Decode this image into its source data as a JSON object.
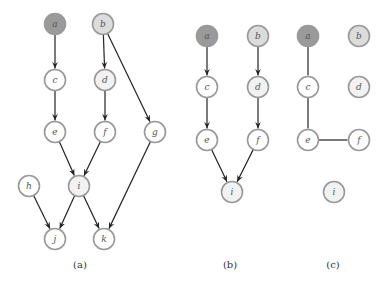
{
  "colors": {
    "dark_fill": "#9a9a9a",
    "light_fill": "#dcdcdc",
    "white_fill": "#ffffff",
    "very_light_fill": "#f2f2f2",
    "stroke": "#999999",
    "edge": "#222222"
  },
  "panels": [
    {
      "id": "a",
      "caption": "(a)",
      "caption_pos": [
        80,
        268
      ],
      "nodes": [
        {
          "id": "a",
          "label": "a",
          "x": 55,
          "y": 24,
          "fill": "dark"
        },
        {
          "id": "b",
          "label": "b",
          "x": 103,
          "y": 24,
          "fill": "light"
        },
        {
          "id": "c",
          "label": "c",
          "x": 55,
          "y": 80,
          "fill": "white"
        },
        {
          "id": "d",
          "label": "d",
          "x": 105,
          "y": 80,
          "fill": "very_light"
        },
        {
          "id": "e",
          "label": "e",
          "x": 55,
          "y": 132,
          "fill": "white"
        },
        {
          "id": "f",
          "label": "f",
          "x": 105,
          "y": 132,
          "fill": "white"
        },
        {
          "id": "g",
          "label": "g",
          "x": 155,
          "y": 132,
          "fill": "white"
        },
        {
          "id": "h",
          "label": "h",
          "x": 29,
          "y": 186,
          "fill": "white"
        },
        {
          "id": "i",
          "label": "i",
          "x": 79,
          "y": 186,
          "fill": "very_light"
        },
        {
          "id": "j",
          "label": "j",
          "x": 55,
          "y": 239,
          "fill": "white"
        },
        {
          "id": "k",
          "label": "k",
          "x": 104,
          "y": 239,
          "fill": "white"
        }
      ],
      "edges": [
        {
          "from": "a",
          "to": "c",
          "directed": true
        },
        {
          "from": "c",
          "to": "e",
          "directed": true
        },
        {
          "from": "b",
          "to": "d",
          "directed": true
        },
        {
          "from": "d",
          "to": "f",
          "directed": true
        },
        {
          "from": "b",
          "to": "g",
          "directed": true
        },
        {
          "from": "e",
          "to": "i",
          "directed": true
        },
        {
          "from": "f",
          "to": "i",
          "directed": true
        },
        {
          "from": "h",
          "to": "j",
          "directed": true
        },
        {
          "from": "i",
          "to": "j",
          "directed": true
        },
        {
          "from": "i",
          "to": "k",
          "directed": true
        },
        {
          "from": "g",
          "to": "k",
          "directed": true
        }
      ]
    },
    {
      "id": "b",
      "caption": "(b)",
      "caption_pos": [
        230,
        268
      ],
      "nodes": [
        {
          "id": "a",
          "label": "a",
          "x": 207,
          "y": 36,
          "fill": "dark"
        },
        {
          "id": "b",
          "label": "b",
          "x": 258,
          "y": 36,
          "fill": "light"
        },
        {
          "id": "c",
          "label": "c",
          "x": 207,
          "y": 87,
          "fill": "white"
        },
        {
          "id": "d",
          "label": "d",
          "x": 258,
          "y": 87,
          "fill": "very_light"
        },
        {
          "id": "e",
          "label": "e",
          "x": 207,
          "y": 140,
          "fill": "white"
        },
        {
          "id": "f",
          "label": "f",
          "x": 258,
          "y": 140,
          "fill": "white"
        },
        {
          "id": "i",
          "label": "i",
          "x": 232,
          "y": 192,
          "fill": "very_light"
        }
      ],
      "edges": [
        {
          "from": "a",
          "to": "c",
          "directed": true
        },
        {
          "from": "c",
          "to": "e",
          "directed": true
        },
        {
          "from": "b",
          "to": "d",
          "directed": true
        },
        {
          "from": "d",
          "to": "f",
          "directed": true
        },
        {
          "from": "e",
          "to": "i",
          "directed": true
        },
        {
          "from": "f",
          "to": "i",
          "directed": true
        }
      ]
    },
    {
      "id": "c",
      "caption": "(c)",
      "caption_pos": [
        333,
        268
      ],
      "nodes": [
        {
          "id": "a",
          "label": "a",
          "x": 308,
          "y": 36,
          "fill": "dark"
        },
        {
          "id": "b",
          "label": "b",
          "x": 359,
          "y": 36,
          "fill": "light"
        },
        {
          "id": "c",
          "label": "c",
          "x": 308,
          "y": 87,
          "fill": "white"
        },
        {
          "id": "d",
          "label": "d",
          "x": 359,
          "y": 87,
          "fill": "very_light"
        },
        {
          "id": "e",
          "label": "e",
          "x": 308,
          "y": 140,
          "fill": "white"
        },
        {
          "id": "f",
          "label": "f",
          "x": 359,
          "y": 140,
          "fill": "white"
        },
        {
          "id": "i",
          "label": "i",
          "x": 334,
          "y": 192,
          "fill": "very_light"
        }
      ],
      "edges": [
        {
          "from": "a",
          "to": "c",
          "directed": false
        },
        {
          "from": "c",
          "to": "e",
          "directed": false
        },
        {
          "from": "e",
          "to": "f",
          "directed": false
        }
      ]
    }
  ]
}
